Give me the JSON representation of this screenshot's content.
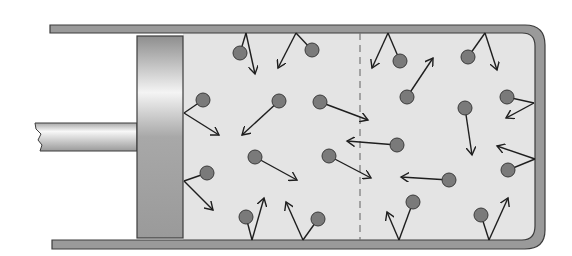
{
  "diagram": {
    "colors": {
      "background": "#ffffff",
      "cylinder_wall": "#9a9a9a",
      "wall_stroke": "#3c3c3c",
      "gas": "#e4e4e4",
      "molecule_fill": "#7a7a7a",
      "molecule_stroke": "#3a3a3a",
      "arrow": "#1e1e1e",
      "divider": "#777777"
    },
    "divider": {
      "style": "dashed",
      "x": 360
    },
    "molecules": [
      {
        "cx": 240,
        "cy": 53,
        "from": [
          246,
          33
        ],
        "to": [
          255,
          74
        ]
      },
      {
        "cx": 312,
        "cy": 50,
        "from": [
          296,
          33
        ],
        "to": [
          278,
          68
        ]
      },
      {
        "cx": 400,
        "cy": 61,
        "from": [
          388,
          33
        ],
        "to": [
          372,
          68
        ]
      },
      {
        "cx": 468,
        "cy": 57,
        "from": [
          485,
          33
        ],
        "to": [
          497,
          70
        ]
      },
      {
        "cx": 203,
        "cy": 100,
        "from": [
          184,
          113
        ],
        "to": [
          219,
          135
        ]
      },
      {
        "cx": 279,
        "cy": 101,
        "from": [
          279,
          101
        ],
        "to": [
          242,
          135
        ]
      },
      {
        "cx": 320,
        "cy": 102,
        "from": [
          320,
          102
        ],
        "to": [
          368,
          120
        ]
      },
      {
        "cx": 407,
        "cy": 97,
        "from": [
          407,
          97
        ],
        "to": [
          433,
          58
        ]
      },
      {
        "cx": 465,
        "cy": 108,
        "from": [
          465,
          108
        ],
        "to": [
          472,
          155
        ]
      },
      {
        "cx": 507,
        "cy": 97,
        "from": [
          534,
          103
        ],
        "to": [
          506,
          118
        ]
      },
      {
        "cx": 255,
        "cy": 157,
        "from": [
          255,
          157
        ],
        "to": [
          297,
          180
        ]
      },
      {
        "cx": 329,
        "cy": 156,
        "from": [
          329,
          156
        ],
        "to": [
          371,
          178
        ]
      },
      {
        "cx": 397,
        "cy": 145,
        "from": [
          397,
          145
        ],
        "to": [
          347,
          141
        ]
      },
      {
        "cx": 449,
        "cy": 180,
        "from": [
          449,
          180
        ],
        "to": [
          401,
          177
        ]
      },
      {
        "cx": 207,
        "cy": 173,
        "from": [
          184,
          181
        ],
        "to": [
          213,
          210
        ]
      },
      {
        "cx": 508,
        "cy": 170,
        "from": [
          535,
          159
        ],
        "to": [
          497,
          146
        ]
      },
      {
        "cx": 246,
        "cy": 217,
        "from": [
          252,
          240
        ],
        "to": [
          264,
          198
        ]
      },
      {
        "cx": 318,
        "cy": 219,
        "from": [
          303,
          240
        ],
        "to": [
          286,
          202
        ]
      },
      {
        "cx": 413,
        "cy": 202,
        "from": [
          399,
          240
        ],
        "to": [
          387,
          212
        ]
      },
      {
        "cx": 481,
        "cy": 215,
        "from": [
          489,
          240
        ],
        "to": [
          508,
          198
        ]
      }
    ]
  }
}
